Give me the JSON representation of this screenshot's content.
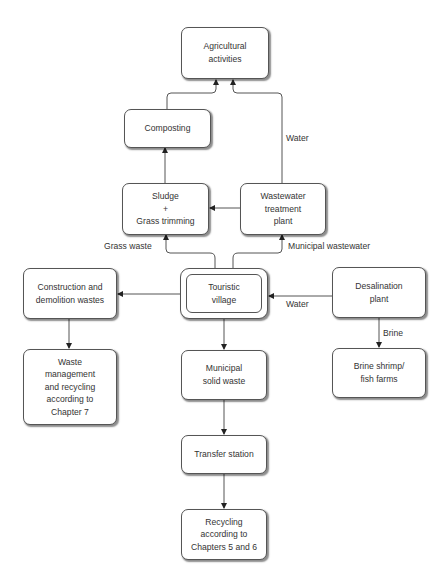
{
  "diagram": {
    "type": "flowchart",
    "nodes": {
      "agricultural": "Agricultural\nactivities",
      "composting": "Composting",
      "sludge": "Sludge\n+\nGrass trimming",
      "wwtp": "Wastewater\ntreatment\nplant",
      "touristic": "Touristic\nvillage",
      "construction": "Construction and\ndemolition wastes",
      "desalination": "Desalination\nplant",
      "waste_mgmt": "Waste\nmanagement\nand recycling\naccording to\nChapter 7",
      "municipal_solid": "Municipal\nsolid waste",
      "brine_shrimp": "Brine shrimp/\nfish farms",
      "transfer": "Transfer station",
      "recycling": "Recycling\naccording to\nChapters 5 and 6"
    },
    "edge_labels": {
      "water_top": "Water",
      "grass_waste": "Grass waste",
      "municipal_wastewater": "Municipal wastewater",
      "water_desal": "Water",
      "brine": "Brine"
    },
    "edges": [
      {
        "from": "composting",
        "to": "agricultural"
      },
      {
        "from": "wwtp",
        "to": "agricultural",
        "label": "Water"
      },
      {
        "from": "sludge",
        "to": "composting"
      },
      {
        "from": "wwtp",
        "to": "sludge"
      },
      {
        "from": "touristic",
        "to": "sludge",
        "label": "Grass waste"
      },
      {
        "from": "touristic",
        "to": "wwtp",
        "label": "Municipal wastewater"
      },
      {
        "from": "touristic",
        "to": "construction"
      },
      {
        "from": "desalination",
        "to": "touristic",
        "label": "Water"
      },
      {
        "from": "construction",
        "to": "waste_mgmt"
      },
      {
        "from": "touristic",
        "to": "municipal_solid"
      },
      {
        "from": "desalination",
        "to": "brine_shrimp",
        "label": "Brine"
      },
      {
        "from": "municipal_solid",
        "to": "transfer"
      },
      {
        "from": "transfer",
        "to": "recycling"
      }
    ]
  }
}
